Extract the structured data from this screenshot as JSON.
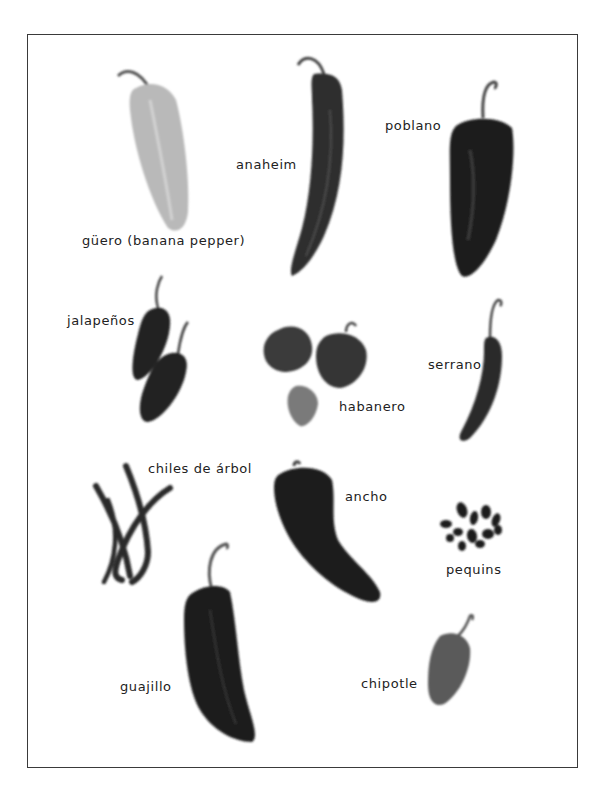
{
  "figure": {
    "border_color": "#3a3a3a",
    "background": "#ffffff",
    "label_color": "#222222"
  },
  "peppers": [
    {
      "id": "guero",
      "label": "güero (banana pepper)",
      "shade": "#b8b8b8"
    },
    {
      "id": "anaheim",
      "label": "anaheim",
      "shade": "#2e2e2e"
    },
    {
      "id": "poblano",
      "label": "poblano",
      "shade": "#1c1c1c"
    },
    {
      "id": "jalapenos",
      "label": "jalapeños",
      "shade": "#222222"
    },
    {
      "id": "habanero",
      "label": "habanero",
      "shade": "#3c3c3c"
    },
    {
      "id": "serrano",
      "label": "serrano",
      "shade": "#2a2a2a"
    },
    {
      "id": "chiles-de-arbol",
      "label": "chiles de árbol",
      "shade": "#2a2a2a"
    },
    {
      "id": "ancho",
      "label": "ancho",
      "shade": "#1a1a1a"
    },
    {
      "id": "pequins",
      "label": "pequins",
      "shade": "#1e1e1e"
    },
    {
      "id": "guajillo",
      "label": "guajillo",
      "shade": "#1f1f1f"
    },
    {
      "id": "chipotle",
      "label": "chipotle",
      "shade": "#5a5a5a"
    }
  ]
}
